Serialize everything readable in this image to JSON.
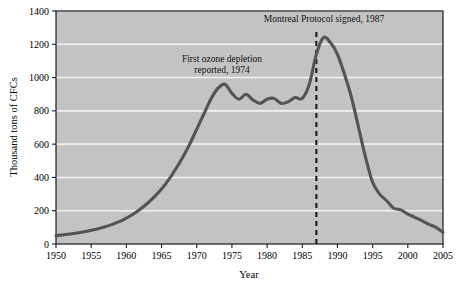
{
  "chart_data": {
    "type": "line",
    "title": "",
    "xlabel": "Year",
    "ylabel": "Thousand tons of CFCs",
    "xlim": [
      1950,
      2005
    ],
    "ylim": [
      0,
      1400
    ],
    "grid": true,
    "legend": "none",
    "xticks": [
      1950,
      1955,
      1960,
      1965,
      1970,
      1975,
      1980,
      1985,
      1990,
      1995,
      2000,
      2005
    ],
    "yticks": [
      0,
      200,
      400,
      600,
      800,
      1000,
      1200,
      1400
    ],
    "series": [
      {
        "name": "CFC production",
        "x": [
          1950,
          1951,
          1952,
          1953,
          1954,
          1955,
          1956,
          1957,
          1958,
          1959,
          1960,
          1961,
          1962,
          1963,
          1964,
          1965,
          1966,
          1967,
          1968,
          1969,
          1970,
          1971,
          1972,
          1973,
          1974,
          1975,
          1976,
          1977,
          1978,
          1979,
          1980,
          1981,
          1982,
          1983,
          1984,
          1985,
          1986,
          1987,
          1988,
          1989,
          1990,
          1991,
          1992,
          1993,
          1994,
          1995,
          1996,
          1997,
          1998,
          1999,
          2000,
          2001,
          2002,
          2003,
          2004,
          2005
        ],
        "y": [
          50,
          55,
          60,
          66,
          73,
          82,
          92,
          104,
          118,
          134,
          155,
          180,
          210,
          245,
          285,
          330,
          385,
          450,
          520,
          600,
          690,
          780,
          870,
          935,
          960,
          905,
          870,
          900,
          865,
          845,
          870,
          875,
          845,
          855,
          880,
          875,
          960,
          1140,
          1240,
          1210,
          1140,
          1020,
          880,
          700,
          520,
          370,
          300,
          260,
          215,
          205,
          180,
          160,
          140,
          118,
          100,
          70
        ]
      }
    ],
    "annotations": [
      {
        "id": "ozone-depletion-note",
        "lines": [
          "First ozone depletion",
          "reported, 1974"
        ],
        "x_px": 222,
        "y_px": 62
      },
      {
        "id": "montreal-protocol-note",
        "lines": [
          "Montreal Protocol signed, 1987"
        ],
        "x_px": 324,
        "y_px": 22
      }
    ],
    "reference_line": {
      "id": "montreal-protocol-1987",
      "x_value": 1987,
      "style": "dashed",
      "color": "#1a1a1a"
    }
  },
  "style": {
    "plot_background": "#c3c3c3",
    "grid_color": "#f2f2f2",
    "line_color": "#545454",
    "axis_color": "#1a1a1a",
    "page_background": "#ffffff"
  }
}
